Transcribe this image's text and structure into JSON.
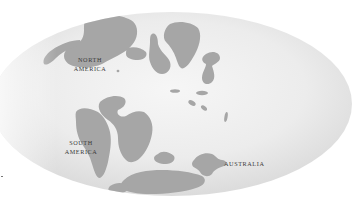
{
  "map": {
    "title": "",
    "projection": "elliptical",
    "colors": {
      "background": "#ffffff",
      "ocean_light": "#f4f4f4",
      "ocean_dark": "#dadada",
      "landmass": "#a6a6a6",
      "label_text": "#3a3a3a"
    },
    "labels": {
      "north_america_line1": "NORTH",
      "north_america_line2": "AMERICA",
      "south_america_line1": "SOUTH",
      "south_america_line2": "AMERICA",
      "australia": "AUSTRALIA"
    },
    "landmasses": [
      {
        "name": "north-america"
      },
      {
        "name": "south-america"
      },
      {
        "name": "africa"
      },
      {
        "name": "eurasia-fragments"
      },
      {
        "name": "india"
      },
      {
        "name": "antarctica"
      },
      {
        "name": "australia"
      },
      {
        "name": "island-arcs"
      }
    ]
  }
}
